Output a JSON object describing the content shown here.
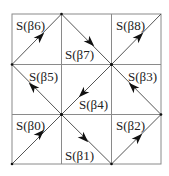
{
  "diagram": {
    "title": "",
    "grid": {
      "rows": 3,
      "cols": 3,
      "origin": [
        12,
        14
      ],
      "cell": 50
    },
    "colors": {
      "grid": "#8a8a8a",
      "path": "#555555",
      "arrow": "#111111",
      "text": "#222222"
    },
    "cells": [
      {
        "id": "beta6",
        "label": "S(β6)",
        "row": 0,
        "col": 0,
        "direction": "up-right"
      },
      {
        "id": "beta7",
        "label": "S(β7)",
        "row": 0,
        "col": 1,
        "direction": "down-right"
      },
      {
        "id": "beta8",
        "label": "S(β8)",
        "row": 0,
        "col": 2,
        "direction": "up-right"
      },
      {
        "id": "beta5",
        "label": "S(β5)",
        "row": 1,
        "col": 0,
        "direction": "up-left"
      },
      {
        "id": "beta4",
        "label": "S(β4)",
        "row": 1,
        "col": 1,
        "direction": "down-left"
      },
      {
        "id": "beta3",
        "label": "S(β3)",
        "row": 1,
        "col": 2,
        "direction": "up-left"
      },
      {
        "id": "beta0",
        "label": "S(β0)",
        "row": 2,
        "col": 0,
        "direction": "up-right"
      },
      {
        "id": "beta1",
        "label": "S(β1)",
        "row": 2,
        "col": 1,
        "direction": "down-right"
      },
      {
        "id": "beta2",
        "label": "S(β2)",
        "row": 2,
        "col": 2,
        "direction": "up-right"
      }
    ],
    "labels": {
      "b0": "S(β0)",
      "b1": "S(β1)",
      "b2": "S(β2)",
      "b3": "S(β3)",
      "b4": "S(β4)",
      "b5": "S(β5)",
      "b6": "S(β6)",
      "b7": "S(β7)",
      "b8": "S(β8)"
    }
  }
}
